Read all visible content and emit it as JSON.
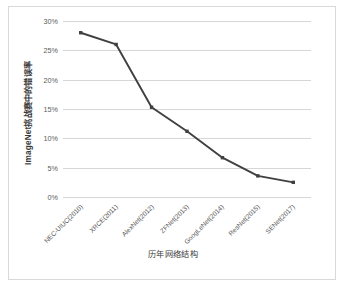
{
  "chart_data": {
    "type": "line",
    "title": "",
    "xlabel": "历年网络结构",
    "ylabel": "ImageNet挑战赛中的错误率",
    "categories": [
      "NEC-UIUC(2010)",
      "XRCE(2011)",
      "AlexNet(2012)",
      "ZFNet(2013)",
      "GoogLeNet(2014)",
      "ResNet(2015)",
      "SENet(2017)"
    ],
    "values": [
      28.0,
      26.0,
      15.3,
      11.2,
      6.7,
      3.6,
      2.5
    ],
    "ylim": [
      0,
      30
    ],
    "ytick_values": [
      0,
      5,
      10,
      15,
      20,
      25,
      30
    ],
    "ytick_labels": [
      "0%",
      "5%",
      "10%",
      "15%",
      "20%",
      "25%",
      "30%"
    ],
    "grid": true,
    "legend": false,
    "series_color": "#404040",
    "grid_color": "#d6d6d6",
    "marker": "square",
    "background": "#ffffff",
    "border_color": "#d9d9d9"
  }
}
